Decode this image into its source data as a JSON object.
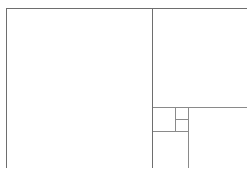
{
  "diagram": {
    "background_color": "#ffffff",
    "stroke_color": "#6e6e6e",
    "stroke_color_light": "#8a8a8a",
    "stroke_width": 1,
    "canvas": {
      "width": 249,
      "height": 178
    },
    "outer_frame": {
      "name": "outer-rectangle",
      "x": 6,
      "y": 8,
      "width": 240,
      "height": 159,
      "label": ""
    },
    "cells": [
      {
        "id": "cell-1",
        "name": "large-square",
        "x": 6,
        "y": 8,
        "width": 146,
        "height": 159,
        "label": ""
      },
      {
        "id": "cell-2",
        "name": "upper-right-square",
        "x": 152,
        "y": 8,
        "width": 94,
        "height": 99,
        "label": ""
      },
      {
        "id": "cell-3",
        "name": "lower-right-square",
        "x": 188,
        "y": 107,
        "width": 58,
        "height": 60,
        "label": ""
      },
      {
        "id": "cell-4",
        "name": "lower-left-small-square",
        "x": 152,
        "y": 131,
        "width": 36,
        "height": 36,
        "label": ""
      },
      {
        "id": "cell-5",
        "name": "mid-small-square",
        "x": 152,
        "y": 107,
        "width": 23,
        "height": 24,
        "label": ""
      },
      {
        "id": "cell-6",
        "name": "tiny-square-upper",
        "x": 175,
        "y": 107,
        "width": 13,
        "height": 12,
        "label": ""
      },
      {
        "id": "cell-7",
        "name": "tiny-square-lower",
        "x": 175,
        "y": 119,
        "width": 13,
        "height": 12,
        "label": ""
      }
    ],
    "dividers": [
      {
        "id": "div-1",
        "name": "main-vertical-divider",
        "orientation": "vertical",
        "x1": 152,
        "y1": 8,
        "x2": 152,
        "y2": 167
      },
      {
        "id": "div-2",
        "name": "right-horizontal-divider",
        "orientation": "horizontal",
        "x1": 152,
        "y1": 107,
        "x2": 246,
        "y2": 107
      },
      {
        "id": "div-3",
        "name": "lower-right-vertical-divider",
        "orientation": "vertical",
        "x1": 188,
        "y1": 107,
        "x2": 188,
        "y2": 167
      },
      {
        "id": "div-4",
        "name": "small-horizontal-divider",
        "orientation": "horizontal",
        "x1": 152,
        "y1": 131,
        "x2": 188,
        "y2": 131
      },
      {
        "id": "div-5",
        "name": "inner-vertical-divider",
        "orientation": "vertical",
        "x1": 175,
        "y1": 107,
        "x2": 175,
        "y2": 131
      },
      {
        "id": "div-6",
        "name": "tiny-horizontal-divider",
        "orientation": "horizontal",
        "x1": 175,
        "y1": 119,
        "x2": 188,
        "y2": 119
      }
    ]
  }
}
